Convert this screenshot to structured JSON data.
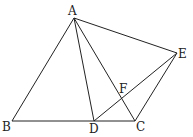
{
  "figure": {
    "points": {
      "A": {
        "label": "A",
        "x": 74,
        "y": 18
      },
      "B": {
        "label": "B",
        "x": 12,
        "y": 121
      },
      "C": {
        "label": "C",
        "x": 135,
        "y": 121
      },
      "D": {
        "label": "D",
        "x": 94,
        "y": 121
      },
      "E": {
        "label": "E",
        "x": 177,
        "y": 53
      },
      "F": {
        "label": "F",
        "x": 123,
        "y": 95
      }
    },
    "segments": [
      "AB",
      "AD",
      "AC",
      "AE",
      "BC",
      "DE",
      "EC"
    ]
  }
}
